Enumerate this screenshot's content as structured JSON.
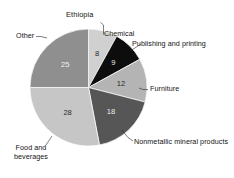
{
  "chart_data": {
    "type": "pie",
    "title": "Ethiopia",
    "subtitle": "",
    "xlabel": "",
    "ylabel": "",
    "legend_position": "none",
    "grid": false,
    "total": 100,
    "value_suffix": "",
    "categories": [
      "Chemical",
      "Publishing and printing",
      "Furniture",
      "Nonmetallic mineral products",
      "Food and beverages",
      "Other"
    ],
    "values": [
      8,
      9,
      12,
      18,
      28,
      25
    ],
    "slices": [
      {
        "label": "Chemical",
        "value": 8,
        "value_text": "8",
        "color": "#d0d0d0",
        "value_color": "#2a2a2a",
        "start_angle": 0,
        "end_angle": 28.8
      },
      {
        "label": "Publishing and printing",
        "value": 9,
        "value_text": "9",
        "color": "#0d0d0d",
        "value_color": "#e8e8e8",
        "start_angle": 28.8,
        "end_angle": 61.2
      },
      {
        "label": "Furniture",
        "value": 12,
        "value_text": "12",
        "color": "#b4b4b4",
        "value_color": "#2a2a2a",
        "start_angle": 61.2,
        "end_angle": 104.4
      },
      {
        "label": "Nonmetallic mineral products",
        "value": 18,
        "value_text": "18",
        "color": "#565656",
        "value_color": "#ededed",
        "start_angle": 104.4,
        "end_angle": 169.2
      },
      {
        "label": "Food and beverages",
        "value": 28,
        "value_text": "28",
        "color": "#c6c6c6",
        "value_color": "#2a2a2a",
        "start_angle": 169.2,
        "end_angle": 270.0
      },
      {
        "label": "Other",
        "value": 25,
        "value_text": "25",
        "color": "#8f8f8f",
        "value_color": "#efefef",
        "start_angle": 270.0,
        "end_angle": 360.0
      }
    ],
    "callout_labels": [
      {
        "name": "chemical",
        "text": "Chemical"
      },
      {
        "name": "publishing-and-printing",
        "text": "Publishing and printing"
      },
      {
        "name": "furniture",
        "text": "Furniture"
      },
      {
        "name": "nonmetallic-mineral-products",
        "text": "Nonmetallic mineral products"
      },
      {
        "name": "food-and-beverages-line1",
        "text": "Food and"
      },
      {
        "name": "food-and-beverages-line2",
        "text": "beverages"
      },
      {
        "name": "other",
        "text": "Other"
      }
    ]
  }
}
